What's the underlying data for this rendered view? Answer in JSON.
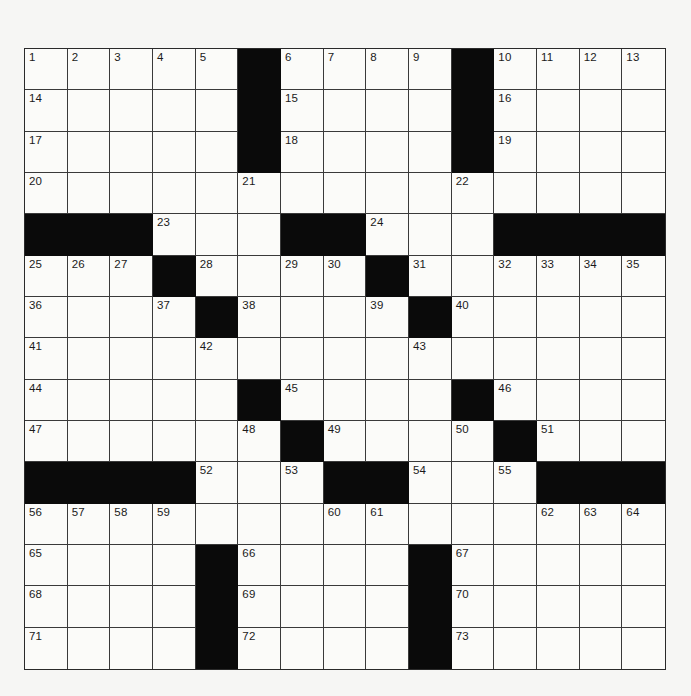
{
  "puzzle": {
    "type": "crossword",
    "size": {
      "rows": 15,
      "cols": 15
    },
    "colors": {
      "block": "#0a0a0a",
      "cell": "#fbfbf9",
      "grid_line": "#3a3a3a",
      "number": "#1a1a1a",
      "page": "#f6f6f4"
    },
    "legend": {
      "block": "#",
      "empty": ""
    },
    "grid": [
      [
        "1",
        "2",
        "3",
        "4",
        "5",
        "#",
        "6",
        "7",
        "8",
        "9",
        "#",
        "10",
        "11",
        "12",
        "13"
      ],
      [
        "14",
        "",
        "",
        "",
        "",
        "#",
        "15",
        "",
        "",
        "",
        "#",
        "16",
        "",
        "",
        ""
      ],
      [
        "17",
        "",
        "",
        "",
        "",
        "#",
        "18",
        "",
        "",
        "",
        "#",
        "19",
        "",
        "",
        ""
      ],
      [
        "20",
        "",
        "",
        "",
        "",
        "21",
        "",
        "",
        "",
        "",
        "22",
        "",
        "",
        "",
        ""
      ],
      [
        "#",
        "#",
        "#",
        "23",
        "",
        "",
        "#",
        "#",
        "24",
        "",
        "",
        "#",
        "#",
        "#",
        "#"
      ],
      [
        "25",
        "26",
        "27",
        "#",
        "28",
        "",
        "29",
        "30",
        "#",
        "31",
        "",
        "32",
        "33",
        "34",
        "35"
      ],
      [
        "36",
        "",
        "",
        "37",
        "#",
        "38",
        "",
        "",
        "39",
        "#",
        "40",
        "",
        "",
        "",
        ""
      ],
      [
        "41",
        "",
        "",
        "",
        "42",
        "",
        "",
        "",
        "",
        "43",
        "",
        "",
        "",
        "",
        ""
      ],
      [
        "44",
        "",
        "",
        "",
        "",
        "#",
        "45",
        "",
        "",
        "",
        "#",
        "46",
        "",
        "",
        ""
      ],
      [
        "47",
        "",
        "",
        "",
        "",
        "48",
        "#",
        "49",
        "",
        "",
        "50",
        "#",
        "51",
        "",
        ""
      ],
      [
        "#",
        "#",
        "#",
        "#",
        "52",
        "",
        "53",
        "#",
        "#",
        "54",
        "",
        "55",
        "#",
        "#",
        "#"
      ],
      [
        "56",
        "57",
        "58",
        "59",
        "",
        "",
        "",
        "60",
        "61",
        "",
        "",
        "",
        "62",
        "63",
        "64"
      ],
      [
        "65",
        "",
        "",
        "",
        "#",
        "66",
        "",
        "",
        "",
        "#",
        "67",
        "",
        "",
        "",
        ""
      ],
      [
        "68",
        "",
        "",
        "",
        "#",
        "69",
        "",
        "",
        "",
        "#",
        "70",
        "",
        "",
        "",
        ""
      ],
      [
        "71",
        "",
        "",
        "",
        "#",
        "72",
        "",
        "",
        "",
        "#",
        "73",
        "",
        "",
        "",
        ""
      ]
    ],
    "answers": []
  }
}
